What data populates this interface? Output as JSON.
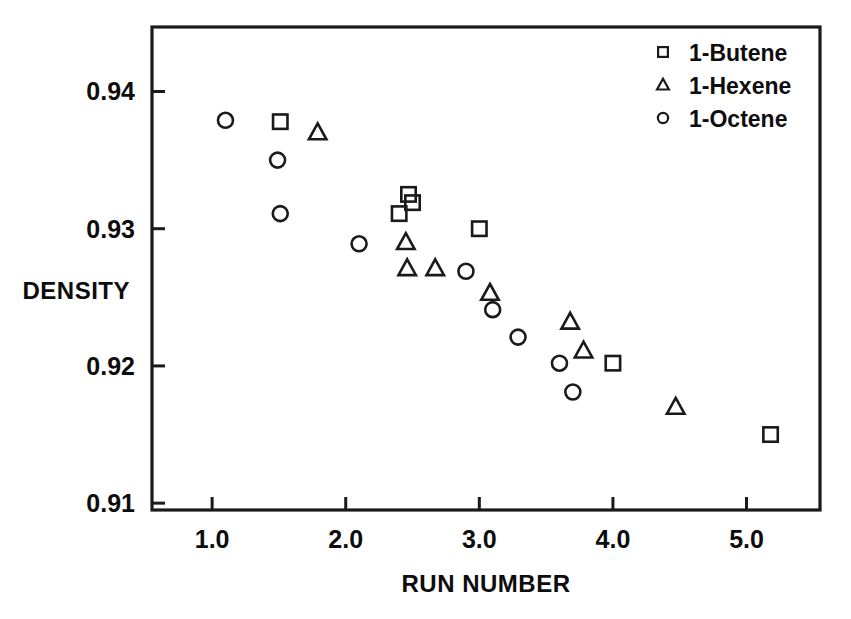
{
  "chart_data": {
    "type": "scatter",
    "title": "",
    "xlabel": "RUN NUMBER",
    "ylabel": "DENSITY",
    "xlim": [
      0.55,
      5.55
    ],
    "ylim": [
      0.9095,
      0.9447
    ],
    "grid": false,
    "legend_position": "top-right",
    "xticks": [
      "1.0",
      "2.0",
      "3.0",
      "4.0",
      "5.0"
    ],
    "xtick_values": [
      1.0,
      2.0,
      3.0,
      4.0,
      5.0
    ],
    "yticks": [
      "0.94",
      "0.93",
      "0.92",
      "0.91"
    ],
    "ytick_values": [
      0.94,
      0.93,
      0.92,
      0.91
    ],
    "series": [
      {
        "name": "1-Butene",
        "marker": "square",
        "points": [
          {
            "x": 1.51,
            "y": 0.9378
          },
          {
            "x": 2.4,
            "y": 0.9311
          },
          {
            "x": 2.47,
            "y": 0.9325
          },
          {
            "x": 2.5,
            "y": 0.9319
          },
          {
            "x": 3.0,
            "y": 0.93
          },
          {
            "x": 4.0,
            "y": 0.9202
          },
          {
            "x": 5.18,
            "y": 0.915
          }
        ]
      },
      {
        "name": "1-Hexene",
        "marker": "triangle",
        "points": [
          {
            "x": 1.79,
            "y": 0.937
          },
          {
            "x": 2.45,
            "y": 0.929
          },
          {
            "x": 2.46,
            "y": 0.9271
          },
          {
            "x": 2.67,
            "y": 0.9271
          },
          {
            "x": 3.08,
            "y": 0.9253
          },
          {
            "x": 3.68,
            "y": 0.9232
          },
          {
            "x": 3.78,
            "y": 0.9211
          },
          {
            "x": 4.47,
            "y": 0.917
          }
        ]
      },
      {
        "name": "1-Octene",
        "marker": "circle",
        "points": [
          {
            "x": 1.1,
            "y": 0.9379
          },
          {
            "x": 1.49,
            "y": 0.935
          },
          {
            "x": 1.51,
            "y": 0.9311
          },
          {
            "x": 2.1,
            "y": 0.9289
          },
          {
            "x": 2.9,
            "y": 0.9269
          },
          {
            "x": 3.1,
            "y": 0.9241
          },
          {
            "x": 3.29,
            "y": 0.9221
          },
          {
            "x": 3.6,
            "y": 0.9202
          },
          {
            "x": 3.7,
            "y": 0.9181
          }
        ]
      }
    ]
  },
  "legend": {
    "entries": [
      {
        "label": "1-Butene",
        "marker": "square"
      },
      {
        "label": "1-Hexene",
        "marker": "triangle"
      },
      {
        "label": "1-Octene",
        "marker": "circle"
      }
    ]
  }
}
